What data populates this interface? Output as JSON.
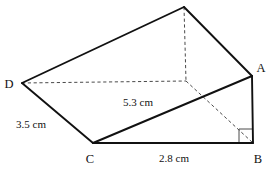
{
  "figure": {
    "kind": "triangular-prism",
    "background_color": "#ffffff",
    "solid_edge_color": "#111111",
    "hidden_edge_color": "#4a4a4a"
  },
  "vertices": {
    "A": {
      "label": "A",
      "x": 252,
      "y": 76,
      "label_x": 261,
      "label_y": 72,
      "hidden": false
    },
    "B": {
      "label": "B",
      "x": 253,
      "y": 143,
      "label_x": 256,
      "label_y": 162,
      "hidden": false
    },
    "C": {
      "label": "C",
      "x": 93,
      "y": 143,
      "label_x": 88,
      "label_y": 162,
      "hidden": false
    },
    "D": {
      "label": "D",
      "x": 22,
      "y": 83,
      "label_x": 4,
      "label_y": 89,
      "hidden": false
    },
    "P": {
      "label": "",
      "x": 184,
      "y": 7,
      "label_x": 0,
      "label_y": 0,
      "hidden": false
    },
    "E": {
      "label": "",
      "x": 186,
      "y": 81,
      "label_x": 0,
      "label_y": 0,
      "hidden": true
    }
  },
  "edges": [
    {
      "name": "edge-D-apex",
      "from": "D",
      "to": "P",
      "style": "solid"
    },
    {
      "name": "edge-apex-A",
      "from": "P",
      "to": "A",
      "style": "solid"
    },
    {
      "name": "edge-D-C",
      "from": "D",
      "to": "C",
      "style": "solid"
    },
    {
      "name": "edge-C-A",
      "from": "C",
      "to": "A",
      "style": "solid"
    },
    {
      "name": "edge-C-B",
      "from": "C",
      "to": "B",
      "style": "solid"
    },
    {
      "name": "edge-A-B",
      "from": "A",
      "to": "B",
      "style": "solid"
    },
    {
      "name": "edge-D-E-hidden",
      "from": "D",
      "to": "E",
      "style": "dashed"
    },
    {
      "name": "edge-apex-E-hidden",
      "from": "P",
      "to": "E",
      "style": "dashed"
    },
    {
      "name": "edge-E-B-hidden",
      "from": "E",
      "to": "B",
      "style": "dashed"
    }
  ],
  "measurements": [
    {
      "name": "slant-height-label",
      "text": "5.3 cm",
      "x": 123,
      "y": 105,
      "edge": "C-A"
    },
    {
      "name": "depth-label",
      "text": "3.5 cm",
      "x": 16,
      "y": 127,
      "edge": "D-C"
    },
    {
      "name": "base-length-label",
      "text": "2.8 cm",
      "x": 159,
      "y": 161,
      "edge": "C-B"
    }
  ],
  "right_angle": {
    "name": "right-angle-marker-at-B",
    "at_vertex": "B",
    "x": 239,
    "y": 129,
    "size": 14
  }
}
